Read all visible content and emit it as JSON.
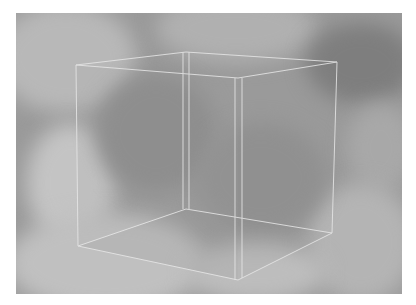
{
  "image": {
    "description": "Wireframe transparent cube over grayscale cloud texture",
    "background_color": "#ffffff",
    "texture_base_color": "#9a9a9a",
    "edge_color": "#e6e6e6",
    "frame": {
      "x": 16,
      "y": 13,
      "width": 386,
      "height": 281
    }
  },
  "cube": {
    "vertices": {
      "front_top_left": [
        76,
        65
      ],
      "front_top_right": [
        238,
        78
      ],
      "front_bottom_left": [
        78,
        246
      ],
      "front_bottom_right": [
        238,
        280
      ],
      "back_top_left": [
        186,
        52
      ],
      "back_top_right": [
        337,
        62
      ],
      "back_bottom_left": [
        186,
        209
      ],
      "back_bottom_right": [
        332,
        233
      ]
    }
  }
}
